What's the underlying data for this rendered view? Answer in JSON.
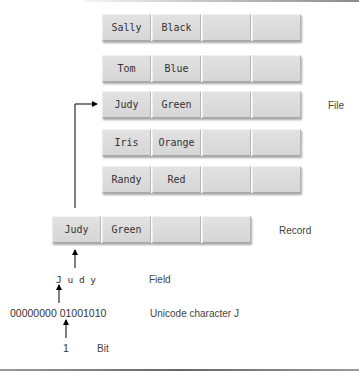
{
  "diagram": {
    "file": {
      "label": "File",
      "records": [
        {
          "name": "Sally",
          "color": "Black"
        },
        {
          "name": "Tom",
          "color": "Blue"
        },
        {
          "name": "Judy",
          "color": "Green"
        },
        {
          "name": "Iris",
          "color": "Orange"
        },
        {
          "name": "Randy",
          "color": "Red"
        }
      ]
    },
    "record": {
      "label": "Record",
      "name": "Judy",
      "color": "Green"
    },
    "field": {
      "label": "Field",
      "chars": "J u d y"
    },
    "character": {
      "label": "Unicode character J",
      "bits": "00000000 01001010"
    },
    "bit": {
      "label": "Bit",
      "value": "1"
    },
    "colors": {
      "cell": "#dcdcdc",
      "arrow": "#000000",
      "text": "#333333"
    }
  }
}
